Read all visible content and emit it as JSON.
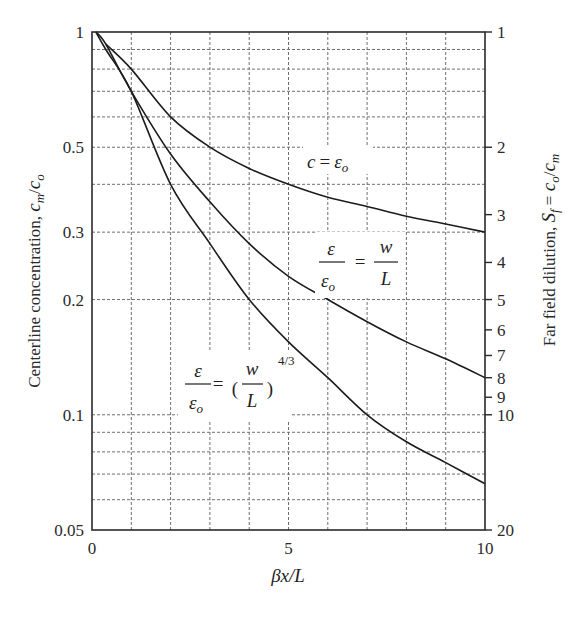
{
  "chart_data": {
    "type": "line",
    "title": "",
    "xlabel": "βx/L",
    "ylabel": "Centerline concentration, c_m/c_o",
    "y2label": "Far field dilution, S_f = c_o/c_m",
    "xlim": [
      0,
      10
    ],
    "ylim": [
      0.05,
      1
    ],
    "yscale": "log",
    "grid": true,
    "x_ticks": [
      0,
      5,
      10
    ],
    "x_tick_labels": [
      "0",
      "5",
      "10"
    ],
    "y_ticks": [
      1,
      0.5,
      0.3,
      0.2,
      0.1,
      0.05
    ],
    "y_tick_labels": [
      "1",
      "0.5",
      "0.3",
      "0.2",
      "0.1",
      "0.05"
    ],
    "y2_ticks": [
      1,
      2,
      3,
      4,
      5,
      6,
      7,
      8,
      9,
      10,
      20
    ],
    "y2_tick_labels": [
      "1",
      "2",
      "3",
      "4",
      "5",
      "6",
      "7",
      "8",
      "9",
      "10",
      "20"
    ],
    "x_grid": [
      1,
      2,
      3,
      4,
      5,
      6,
      7,
      8,
      9
    ],
    "y_grid": [
      0.9,
      0.8,
      0.7,
      0.6,
      0.5,
      0.4,
      0.3,
      0.2,
      0.1,
      0.09,
      0.08,
      0.07,
      0.06
    ],
    "series": [
      {
        "name": "c = ε_o",
        "x": [
          0.35,
          1,
          2,
          3,
          4,
          5,
          6,
          7,
          8,
          9,
          10
        ],
        "values": [
          0.93,
          0.8,
          0.6,
          0.5,
          0.44,
          0.4,
          0.37,
          0.35,
          0.33,
          0.315,
          0.3
        ]
      },
      {
        "name": "ε/ε_o = w/L",
        "x": [
          0.1,
          0.35,
          1,
          2,
          3,
          4,
          5,
          6,
          7,
          8,
          9,
          10
        ],
        "values": [
          1.0,
          0.93,
          0.7,
          0.48,
          0.36,
          0.28,
          0.23,
          0.2,
          0.175,
          0.155,
          0.14,
          0.125
        ]
      },
      {
        "name": "ε/ε_o = (w/L)^(4/3)",
        "x": [
          0.1,
          0.35,
          1,
          2,
          3,
          4,
          5,
          6,
          7,
          8,
          9,
          10
        ],
        "values": [
          1.0,
          0.9,
          0.7,
          0.4,
          0.28,
          0.2,
          0.155,
          0.125,
          0.1,
          0.085,
          0.075,
          0.066
        ]
      }
    ],
    "annotations": [
      {
        "text": "c = ε_o",
        "near_series": 0
      },
      {
        "text": "ε/ε_o = w/L",
        "near_series": 1
      },
      {
        "text": "ε/ε_o = (w/L)^(4/3)",
        "near_series": 2
      }
    ]
  },
  "labels": {
    "xlabel_beta": "β",
    "xlabel_rest": "x/L",
    "ylabel_text": "Centerline concentration, ",
    "ylabel_var": "c",
    "ylabel_sub_m": "m",
    "ylabel_slash": "/",
    "ylabel_var2": "c",
    "ylabel_sub_o": "o",
    "y2label_text": "Far field dilution, ",
    "y2label_var": "S",
    "y2label_sub_f": "f",
    "y2label_eq": " = ",
    "y2label_c": "c",
    "y2label_o": "o",
    "y2label_slash": "/",
    "y2label_c2": "c",
    "y2label_m": "m",
    "ann1_c": "c",
    "ann1_eq": "=",
    "ann1_eps": "ε",
    "ann1_o": "o",
    "ann2_eps": "ε",
    "ann2_eps0": "ε",
    "ann2_o": "o",
    "ann2_eq": "=",
    "ann2_w": "w",
    "ann2_L": "L",
    "ann3_eps": "ε",
    "ann3_eps0": "ε",
    "ann3_o": "o",
    "ann3_eq": "=",
    "ann3_w": "w",
    "ann3_L": "L",
    "ann3_exp": "4/3",
    "ann3_lparen": "(",
    "ann3_rparen": ")"
  }
}
